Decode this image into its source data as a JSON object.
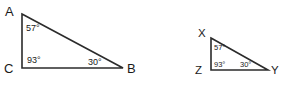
{
  "figure": {
    "background_color": "#ffffff",
    "stroke_color": "#2b2b2b",
    "text_color": "#1a1a1a",
    "degree_symbol": "°",
    "triangles": [
      {
        "id": "triangle-abc",
        "name": "Triangle ABC",
        "size": "large",
        "vertices": [
          {
            "label": "A",
            "position": "top-left",
            "x": 22,
            "y": 14,
            "label_x": 5,
            "label_y": 16
          },
          {
            "label": "C",
            "position": "bottom-left",
            "x": 22,
            "y": 68,
            "label_x": 4,
            "label_y": 73
          },
          {
            "label": "B",
            "position": "bottom-right",
            "x": 123,
            "y": 68,
            "label_x": 127,
            "label_y": 73
          }
        ],
        "angles": [
          {
            "at_vertex": "A",
            "value": "57",
            "text": "57°",
            "x": 26,
            "y": 31
          },
          {
            "at_vertex": "C",
            "value": "93",
            "text": "93°",
            "x": 27,
            "y": 63
          },
          {
            "at_vertex": "B",
            "value": "30",
            "text": "30°",
            "x": 88,
            "y": 65
          }
        ],
        "path": "M 22,14 L 123,68 L 22,68 Z"
      },
      {
        "id": "triangle-xyz",
        "name": "Triangle XYZ",
        "size": "small",
        "vertices": [
          {
            "label": "X",
            "position": "top-left",
            "x": 211,
            "y": 38,
            "label_x": 198,
            "label_y": 37
          },
          {
            "label": "Z",
            "position": "bottom-left",
            "x": 211,
            "y": 70,
            "label_x": 195,
            "label_y": 74
          },
          {
            "label": "Y",
            "position": "bottom-right",
            "x": 268,
            "y": 70,
            "label_x": 271,
            "label_y": 74
          }
        ],
        "angles": [
          {
            "at_vertex": "X",
            "value": "57",
            "text": "57°",
            "x": 214,
            "y": 50
          },
          {
            "at_vertex": "Z",
            "value": "93",
            "text": "93°",
            "x": 214,
            "y": 67
          },
          {
            "at_vertex": "Y",
            "value": "30",
            "text": "30°",
            "x": 240,
            "y": 67
          }
        ],
        "path": "M 211,38 L 268,70 L 211,70 Z"
      }
    ]
  }
}
